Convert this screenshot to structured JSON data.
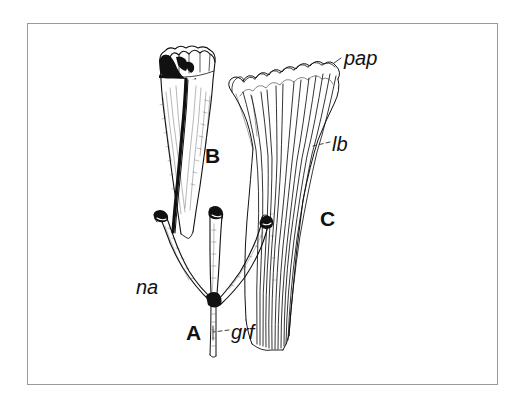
{
  "figure": {
    "background_color": "#ffffff",
    "ink_color": "#111111",
    "frame_color": "#9a9a9a",
    "panels": [
      {
        "id": "A",
        "letter": "A",
        "description": "branched structure with three arms and a central stalk"
      },
      {
        "id": "B",
        "letter": "B",
        "description": "tapering club-shaped structure with crenulate lobed apex and dark shading"
      },
      {
        "id": "C",
        "letter": "C",
        "description": "fan of slender lobes with papillate scalloped tips"
      }
    ],
    "part_labels": [
      {
        "id": "na",
        "text": "na",
        "panel": "A",
        "leader": false
      },
      {
        "id": "grf",
        "text": "grf",
        "panel": "A",
        "leader": true
      },
      {
        "id": "lb",
        "text": "lb",
        "panel": "C",
        "leader": true
      },
      {
        "id": "pap",
        "text": "pap",
        "panel": "C",
        "leader": true
      }
    ]
  }
}
